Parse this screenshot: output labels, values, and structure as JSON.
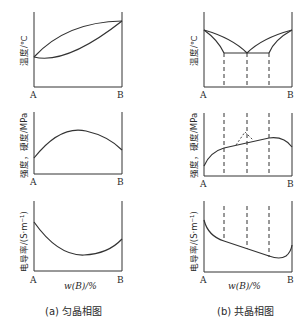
{
  "figure": {
    "panel_a": {
      "caption": "(a) 匀晶相图",
      "plots": [
        {
          "ylabel": "温度/℃",
          "x_start": "A",
          "x_end": "B",
          "xlabel": ""
        },
        {
          "ylabel": "强度，硬度/MPa",
          "x_start": "A",
          "x_end": "B",
          "xlabel": ""
        },
        {
          "ylabel": "电导率/(S·m⁻¹)",
          "x_start": "A",
          "x_end": "B",
          "xlabel": "w(B)/%"
        }
      ]
    },
    "panel_b": {
      "caption": "(b) 共晶相图",
      "plots": [
        {
          "ylabel": "温度/℃",
          "x_start": "A",
          "x_end": "B",
          "xlabel": ""
        },
        {
          "ylabel": "强度，硬度/MPa",
          "x_start": "A",
          "x_end": "B",
          "xlabel": ""
        },
        {
          "ylabel": "电导率/(S·m⁻¹)",
          "x_start": "A",
          "x_end": "B",
          "xlabel": "w(B)/%"
        }
      ]
    }
  }
}
